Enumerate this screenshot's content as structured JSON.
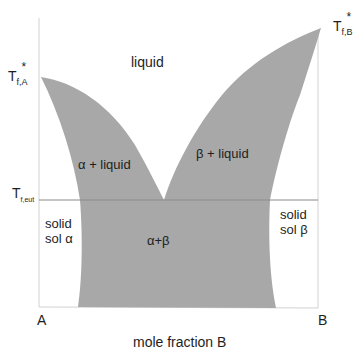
{
  "diagram": {
    "type": "binary eutectic phase diagram",
    "colors": {
      "shade": "#a8a8a8",
      "axis": "#cfcfcf",
      "eutectic_line": "#8a8a8a",
      "text": "#1e1e1e"
    },
    "regions": {
      "liquid": "liquid",
      "alpha_liquid": "α + liquid",
      "beta_liquid": "β + liquid",
      "solid_alpha_line1": "solid",
      "solid_alpha_line2": "sol α",
      "solid_beta_line1": "solid",
      "solid_beta_line2": "sol β",
      "alpha_beta": "α+β"
    },
    "temperature_labels": {
      "tfa_main": "T",
      "tfa_sub": "f,A",
      "tfa_sup": "*",
      "tfb_main": "T",
      "tfb_sub": "f,B",
      "tfb_sup": "*",
      "teut_main": "T",
      "teut_sub": "f,eut"
    },
    "axis": {
      "left_end": "A",
      "right_end": "B",
      "xlabel": "mole fraction B"
    }
  }
}
